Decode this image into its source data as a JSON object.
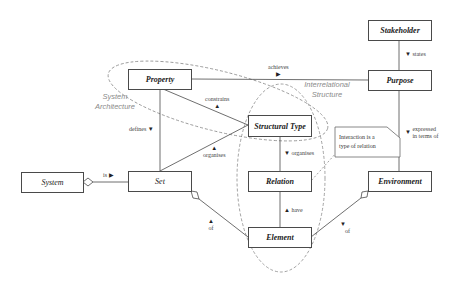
{
  "classes": {
    "stakeholder": "Stakeholder",
    "purpose": "Purpose",
    "property": "Property",
    "structural_type": "Structural Type",
    "system": "System",
    "set": "Set",
    "relation": "Relation",
    "environment": "Environment",
    "element": "Element"
  },
  "associations": {
    "states": "states",
    "achieves": "achieves",
    "constrains": "constrains",
    "defines": "defines",
    "organises_set": "organises",
    "organises_relation": "organises",
    "expressed_line1": "expressed",
    "expressed_line2": "in terms of",
    "is": "is",
    "have": "have",
    "of_set": "of",
    "of_env": "of"
  },
  "arrows": {
    "down": "▼",
    "up": "▲",
    "right": "▶"
  },
  "regions": {
    "system_architecture_line1": "System",
    "system_architecture_line2": "Architecture",
    "interrelational_line1": "Interrelational",
    "interrelational_line2": "Structure"
  },
  "note": {
    "line1": "Interaction is a",
    "line2": "type of relation"
  },
  "colors": {
    "line": "#4a4a4a",
    "dashed": "#8c8c8c",
    "region_text": "#8a8a8a"
  }
}
